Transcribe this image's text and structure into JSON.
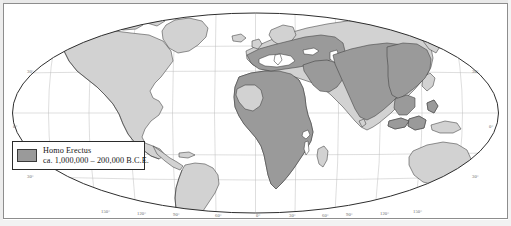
{
  "figure": {
    "type": "world-map",
    "projection": "oval-pseudocylindrical",
    "title": "",
    "background_color": "#ffffff",
    "frame_color": "#8d8d8d"
  },
  "colors": {
    "highlight_range": "#9a9a9a",
    "land": "#d2d2d2",
    "ocean": "#ffffff",
    "coastline": "#3a3a3a",
    "graticule": "#b9b9b9",
    "text": "#161616",
    "label": "#6b6b6b"
  },
  "legend": {
    "title": "Homo Erectus",
    "subtitle": "ca. 1,000,000 – 200,000 B.C.E.",
    "swatch_color": "#9a9a9a",
    "swatch_meaning": "Homo Erectus range"
  },
  "graticule": {
    "latitude_labels_left": [
      {
        "text": "30°",
        "y": 73
      },
      {
        "text": "0°",
        "y": 128
      },
      {
        "text": "30°",
        "y": 178
      }
    ],
    "latitude_labels_right": [
      {
        "text": "30°",
        "y": 73
      },
      {
        "text": "0°",
        "y": 128
      },
      {
        "text": "30°",
        "y": 178
      }
    ],
    "longitude_labels": [
      {
        "text": "150°",
        "x": 104
      },
      {
        "text": "120°",
        "x": 140
      },
      {
        "text": "90°",
        "x": 175
      },
      {
        "text": "60°",
        "x": 218
      },
      {
        "text": "0°",
        "x": 258
      },
      {
        "text": "30°",
        "x": 292
      },
      {
        "text": "60°",
        "x": 325
      },
      {
        "text": "90°",
        "x": 348
      },
      {
        "text": "120°",
        "x": 383
      },
      {
        "text": "150°",
        "x": 416
      }
    ],
    "latitude_lines_deg": [
      60,
      30,
      0,
      -30,
      -60
    ],
    "longitude_lines_deg": [
      -150,
      -120,
      -90,
      -60,
      -30,
      0,
      30,
      60,
      90,
      120,
      150
    ]
  },
  "regions": {
    "highlighted": [
      "Africa (sub-Saharan and north)",
      "Southern Europe",
      "Middle East",
      "South Asia",
      "East Asia",
      "Southeast Asia / Java"
    ],
    "unhighlighted": [
      "North America",
      "South America",
      "Australia",
      "Northern Europe",
      "Siberia",
      "Greenland"
    ]
  }
}
